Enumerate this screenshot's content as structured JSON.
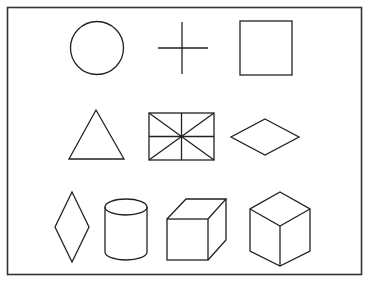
{
  "figure": {
    "background": "#ffffff",
    "stroke_color": "#222222",
    "rows": [
      {
        "shapes": [
          "circle",
          "plus-cross",
          "square"
        ]
      },
      {
        "shapes": [
          "triangle",
          "rectangle-with-diagonals-and-midlines",
          "horizontal-rhombus"
        ]
      },
      {
        "shapes": [
          "vertical-rhombus",
          "cylinder",
          "oblique-cube",
          "isometric-cube"
        ]
      }
    ],
    "shape_count": 10
  }
}
